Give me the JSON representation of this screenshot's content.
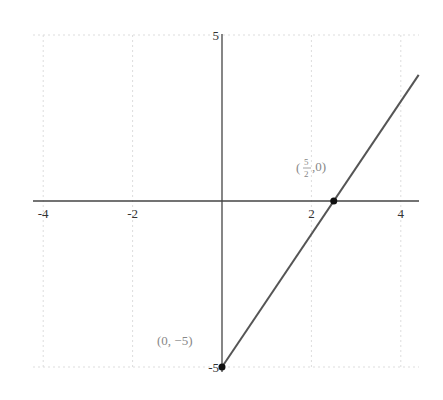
{
  "chart_data": {
    "type": "line",
    "title": "",
    "xlabel": "",
    "ylabel": "",
    "xlim": [
      -4.4,
      4.4
    ],
    "ylim": [
      -5,
      5
    ],
    "grid": true,
    "legend": null,
    "x_ticks": [
      -4,
      -2,
      2,
      4
    ],
    "x_tick_labels": [
      "-4",
      "-2",
      "2",
      "4"
    ],
    "y_ticks": [
      5,
      -5
    ],
    "y_tick_labels": [
      "5",
      "-5"
    ],
    "series": [
      {
        "name": "y = 2x - 5",
        "x": [
          0,
          4.4
        ],
        "y": [
          -5,
          3.8
        ],
        "color": "#555555"
      }
    ],
    "points": [
      {
        "x": 2.5,
        "y": 0,
        "label": "(5/2, 0)",
        "label_num": "5",
        "label_den": "2",
        "label_rest": ",0)"
      },
      {
        "x": 0,
        "y": -5,
        "label": "(0, −5)"
      }
    ],
    "annotations": [
      {
        "text": "(5/2, 0)",
        "near": "x-intercept"
      },
      {
        "text": "(0, −5)",
        "near": "y-intercept"
      }
    ]
  }
}
